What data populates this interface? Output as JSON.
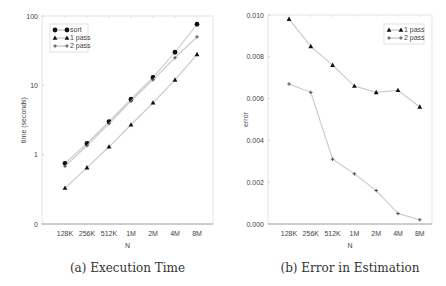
{
  "chart_data": [
    {
      "type": "line",
      "title": "(a) Execution Time",
      "xlabel": "N",
      "ylabel": "time (seconds)",
      "yscale": "log",
      "categories": [
        "128K",
        "256K",
        "512K",
        "1M",
        "2M",
        "4M",
        "8M"
      ],
      "yticks": [
        "0",
        "1",
        "10",
        "100"
      ],
      "ylim": [
        0.1,
        100
      ],
      "legend_position": "upper left",
      "series": [
        {
          "name": "sort",
          "marker": "circle",
          "values": [
            0.75,
            1.45,
            3.0,
            6.3,
            13.0,
            30.0,
            76.0
          ]
        },
        {
          "name": "1 pass",
          "marker": "triangle",
          "values": [
            0.33,
            0.65,
            1.3,
            2.7,
            5.6,
            12.0,
            28.0
          ]
        },
        {
          "name": "2 pass",
          "marker": "plus",
          "values": [
            0.68,
            1.35,
            2.8,
            5.9,
            12.0,
            25.0,
            50.0
          ]
        }
      ]
    },
    {
      "type": "line",
      "title": "(b) Error in Estimation",
      "xlabel": "N",
      "ylabel": "error",
      "categories": [
        "128K",
        "256K",
        "512K",
        "1M",
        "2M",
        "4M",
        "8M"
      ],
      "yticks": [
        "0.000",
        "0.002",
        "0.004",
        "0.006",
        "0.008",
        "0.010"
      ],
      "ylim": [
        0,
        0.01
      ],
      "legend_position": "upper right",
      "series": [
        {
          "name": "1 pass",
          "marker": "triangle",
          "values": [
            0.0098,
            0.0085,
            0.0076,
            0.0066,
            0.0063,
            0.0064,
            0.0056
          ]
        },
        {
          "name": "2 pass",
          "marker": "plus",
          "values": [
            0.0067,
            0.0063,
            0.0031,
            0.0024,
            0.0016,
            0.0005,
            0.0002
          ]
        }
      ]
    }
  ]
}
